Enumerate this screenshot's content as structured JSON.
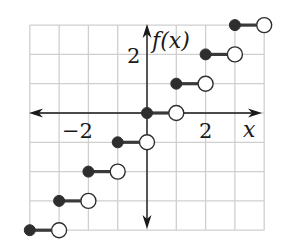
{
  "chart_data": {
    "type": "line",
    "subtype": "step",
    "title": "",
    "xlabel": "x",
    "ylabel": "f(x)",
    "xlim": [
      -4,
      4
    ],
    "ylim": [
      -4,
      3
    ],
    "grid": true,
    "grid_step": 1,
    "tick_labels": {
      "x": [
        {
          "value": -2,
          "label": "−2"
        },
        {
          "value": 2,
          "label": "2"
        }
      ],
      "y": [
        {
          "value": 2,
          "label": "2"
        }
      ]
    },
    "function": "f(x) = floor(x)",
    "segments": [
      {
        "x_start": -4,
        "x_end": -3,
        "y": -4,
        "start": "closed",
        "end": "open"
      },
      {
        "x_start": -3,
        "x_end": -2,
        "y": -3,
        "start": "closed",
        "end": "open"
      },
      {
        "x_start": -2,
        "x_end": -1,
        "y": -2,
        "start": "closed",
        "end": "open"
      },
      {
        "x_start": -1,
        "x_end": 0,
        "y": -1,
        "start": "closed",
        "end": "open"
      },
      {
        "x_start": 0,
        "x_end": 1,
        "y": 0,
        "start": "closed",
        "end": "open"
      },
      {
        "x_start": 1,
        "x_end": 2,
        "y": 1,
        "start": "closed",
        "end": "open"
      },
      {
        "x_start": 2,
        "x_end": 3,
        "y": 2,
        "start": "closed",
        "end": "open"
      },
      {
        "x_start": 3,
        "x_end": 4,
        "y": 3,
        "start": "closed",
        "end": "open"
      }
    ],
    "colors": {
      "grid": "#cfcfcf",
      "axis": "#1a1a1a",
      "series": "#2e2e2e"
    }
  },
  "labels": {
    "x_axis": "x",
    "y_axis": "f(x)",
    "x_tick_neg2": "−2",
    "x_tick_2": "2",
    "y_tick_2": "2"
  }
}
